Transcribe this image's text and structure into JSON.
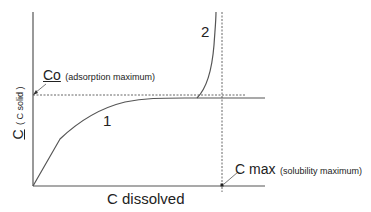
{
  "diagram": {
    "y_axis_label_main": "C",
    "y_axis_label_sub": "( C solid )",
    "x_axis_label": "C dissolved",
    "co_label": "Co",
    "co_note": "(adsorption maximum)",
    "cmax_label": "C max",
    "cmax_note": "(solubility maximum)",
    "curve1_label": "1",
    "curve2_label": "2",
    "colors": {
      "line": "#555555",
      "text": "#222222",
      "background": "#ffffff"
    }
  }
}
